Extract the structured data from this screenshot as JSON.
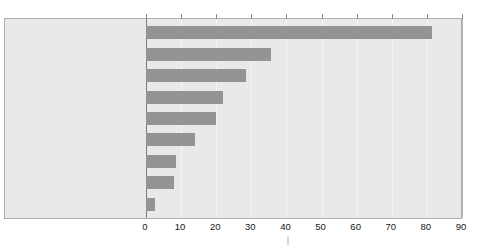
{
  "chart_data": {
    "type": "bar",
    "orientation": "horizontal",
    "title": "",
    "xlabel": "",
    "ylabel": "",
    "xlim": [
      0,
      90
    ],
    "xticks": [
      0,
      10,
      20,
      30,
      40,
      50,
      60,
      70,
      80,
      90
    ],
    "grid": true,
    "legend": false,
    "categories": [
      "Pens, Pencils, or Highlighters",
      "Paper Products",
      "Paper Clips or Binder Clips",
      "Stapler",
      "Scissors",
      "Tape Dispenser",
      "Printer Ink",
      "Binders",
      "Other"
    ],
    "values": [
      81.5,
      35.5,
      28.5,
      22,
      20,
      14,
      8.5,
      8,
      2.5
    ],
    "bars": [
      {
        "label": "Pens, Pencils, or Highlighters",
        "value": 81.5
      },
      {
        "label": "Paper Products",
        "value": 35.5
      },
      {
        "label": "Paper Clips or Binder Clips",
        "value": 28.5
      },
      {
        "label": "Stapler",
        "value": 22
      },
      {
        "label": "Scissors",
        "value": 20
      },
      {
        "label": "Tape Dispenser",
        "value": 14
      },
      {
        "label": "Printer Ink",
        "value": 8.5
      },
      {
        "label": "Binders",
        "value": 8
      },
      {
        "label": "Other",
        "value": 2.5
      }
    ],
    "colors": {
      "bar": "#949494",
      "panel_background": "#e9e9e9",
      "gridline": "#f4f4f4",
      "axis": "#7d7d7d",
      "panel_border": "#aeaeae",
      "text": "#161616",
      "page_background": "#ffffff"
    }
  }
}
